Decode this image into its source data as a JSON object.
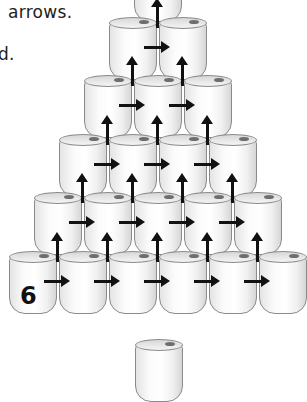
{
  "text": {
    "line1": "arrows.",
    "line2": "d."
  },
  "pyramid": {
    "rows": 6,
    "cans_per_row": [
      1,
      2,
      3,
      4,
      5,
      6
    ],
    "bottom_left_label": "6"
  },
  "loose_can": true,
  "colors": {
    "arrow": "#111111",
    "can_outline": "#8a8a8a",
    "background": "#ffffff"
  }
}
